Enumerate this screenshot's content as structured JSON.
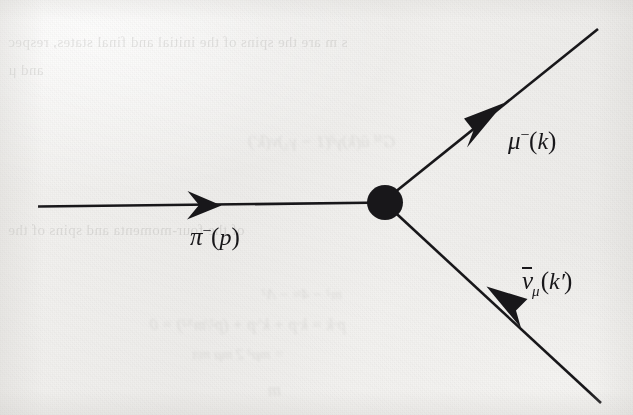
{
  "figure": {
    "kind": "feynman-diagram",
    "background_color": "#f1f0ee",
    "ink_color": "#18171a"
  },
  "diagram": {
    "vertex": {
      "name": "interaction-vertex",
      "shape": "filled-blob",
      "cx": 385,
      "cy": 202,
      "r": 18,
      "color": "#18171a"
    },
    "lines": [
      {
        "name": "pion-line",
        "from": [
          38,
          206
        ],
        "to": [
          385,
          202
        ],
        "arrow_tip": [
          220,
          205
        ],
        "arrow_direction": "right-toward-vertex",
        "width": 2.6
      },
      {
        "name": "muon-line",
        "from": [
          385,
          202
        ],
        "to": [
          597,
          30
        ],
        "arrow_tip": [
          503,
          104
        ],
        "arrow_direction": "up-right-away-from-vertex",
        "width": 2.6
      },
      {
        "name": "antineutrino-line",
        "from": [
          385,
          202
        ],
        "to": [
          600,
          402
        ],
        "arrow_tip": [
          488,
          288
        ],
        "arrow_direction": "up-left-toward-vertex",
        "width": 2.6
      }
    ]
  },
  "labels": {
    "pion": {
      "name": "pion-label",
      "particle": "π",
      "charge": "−",
      "momentum": "p",
      "text": "π⁻(p)",
      "x": 190,
      "y": 224
    },
    "muon": {
      "name": "muon-label",
      "particle": "μ",
      "charge": "−",
      "momentum": "k",
      "text": "μ⁻(k)",
      "x": 508,
      "y": 128
    },
    "antineutrino": {
      "name": "antineutrino-label",
      "particle": "ν",
      "overbar": true,
      "subscript": "μ",
      "momentum": "k′",
      "text": "ν̅μ(k′)",
      "x": 522,
      "y": 268
    }
  },
  "bleed_through": {
    "note": "faint mirrored show-through text from the reverse side of the scanned page",
    "lines": [
      {
        "text": "s m are the spins of the initial and final states, respec",
        "x": 8,
        "y": 34,
        "size": 15
      },
      {
        "text": "and μ",
        "x": 8,
        "y": 62,
        "size": 15
      },
      {
        "text": "Gᴹ ū(k)γᵝ(1 − γ₅)ν(k′)",
        "x": 248,
        "y": 132,
        "size": 17
      },
      {
        "text": "of the four-momenta and spins of the",
        "x": 8,
        "y": 222,
        "size": 15
      },
      {
        "text": "m² − 4≈ − Λ²",
        "x": 262,
        "y": 286,
        "size": 15
      },
      {
        "text": "p·k = k·p + k′·p + (p²/mᴺ²) = 0",
        "x": 150,
        "y": 316,
        "size": 16
      },
      {
        "text": "= mμ²        2        mμ        mπ",
        "x": 192,
        "y": 346,
        "size": 15
      },
      {
        "text": "m",
        "x": 268,
        "y": 380,
        "size": 18
      }
    ]
  }
}
